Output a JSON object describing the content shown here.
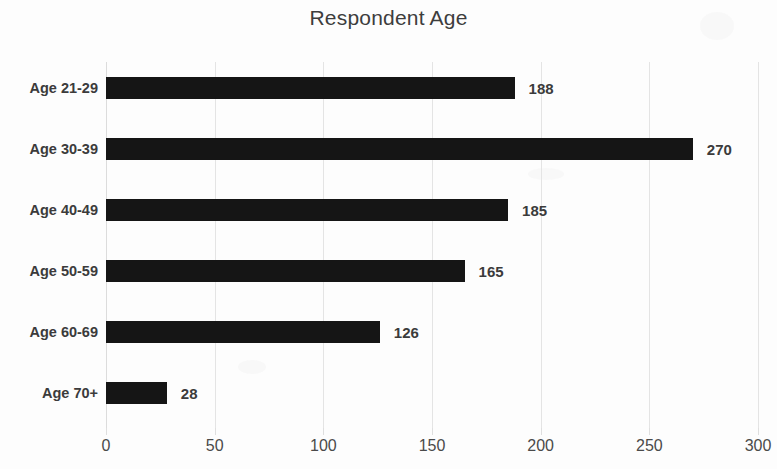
{
  "chart_data": {
    "type": "bar",
    "orientation": "horizontal",
    "title": "Respondent Age",
    "xlabel": "",
    "ylabel": "",
    "categories": [
      "Age 21-29",
      "Age 30-39",
      "Age 40-49",
      "Age 50-59",
      "Age 60-69",
      "Age 70+"
    ],
    "values": [
      188,
      270,
      185,
      165,
      126,
      28
    ],
    "data_labels": [
      "188",
      "270",
      "185",
      "165",
      "126",
      "28"
    ],
    "xlim": [
      0,
      300
    ],
    "xticks": [
      0,
      50,
      100,
      150,
      200,
      250,
      300
    ],
    "xtick_labels": [
      "0",
      "50",
      "100",
      "150",
      "200",
      "250",
      "300"
    ],
    "grid": true,
    "grid_axis": "x",
    "legend": false,
    "bar_color": "#151515",
    "grid_color": "#e4e4e4",
    "text_color": "#3b3b3b",
    "background_color": "#fdfdfd"
  }
}
